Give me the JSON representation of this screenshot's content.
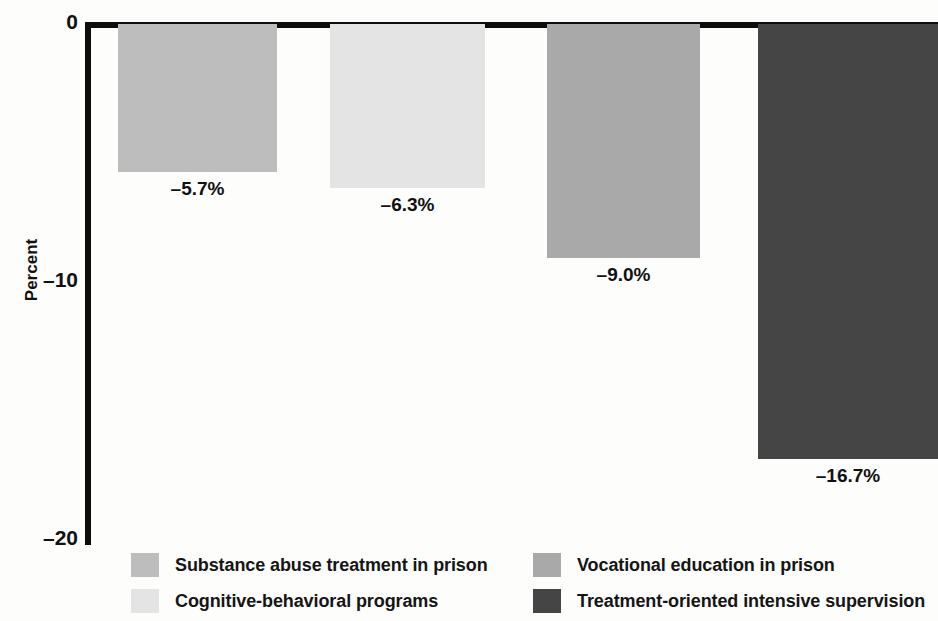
{
  "chart_data": {
    "type": "bar",
    "title": "",
    "xlabel": "",
    "ylabel": "Percent",
    "ylim": [
      -20,
      0
    ],
    "grid": false,
    "orientation": "vertical",
    "bars_direction": "downward-from-zero",
    "legend_position": "bottom",
    "categories": [
      "Substance abuse treatment in prison",
      "Cognitive-behavioral programs",
      "Vocational education in prison",
      "Treatment-oriented intensive supervision"
    ],
    "values": [
      -5.7,
      -6.3,
      -9.0,
      -16.7
    ],
    "value_labels": [
      "–5.7%",
      "–6.3%",
      "–9.0%",
      "–16.7%"
    ],
    "colors": [
      "#bdbdbd",
      "#e4e4e4",
      "#a9a9a9",
      "#454545"
    ],
    "ytick_labels": [
      "0",
      "–10",
      "–20"
    ],
    "ytick_values": [
      0,
      -10,
      -20
    ],
    "axis_color": "#0d0d0d",
    "background_color": "#fdfdfc",
    "text_color": "#111111"
  },
  "legend": {
    "items": [
      {
        "label": "Substance abuse treatment in prison",
        "color": "#bdbdbd"
      },
      {
        "label": "Cognitive-behavioral programs",
        "color": "#e4e4e4"
      },
      {
        "label": "Vocational education in prison",
        "color": "#a9a9a9"
      },
      {
        "label": "Treatment-oriented intensive supervision",
        "color": "#454545"
      }
    ]
  }
}
